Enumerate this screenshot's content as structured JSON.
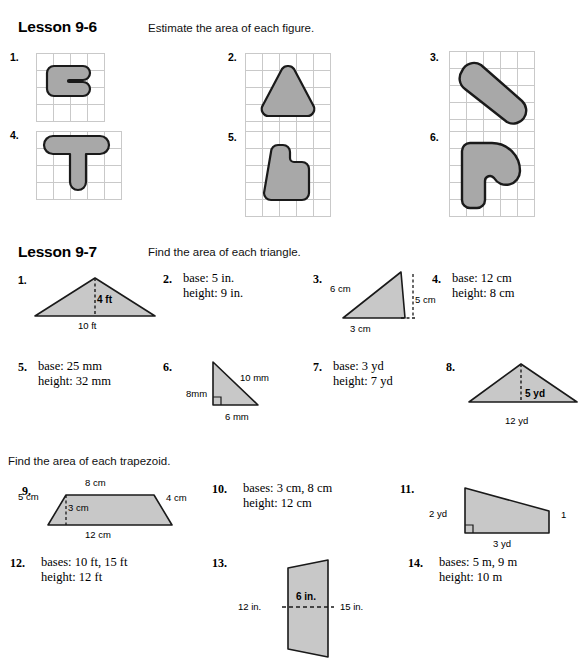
{
  "page": {
    "width": 588,
    "height": 670,
    "background": "#ffffff"
  },
  "style": {
    "shape_fill": "#a8a8a8",
    "shape_fill_light": "#c8c8c8",
    "shape_stroke": "#1a1a1a",
    "grid_line": "#c9c9c9"
  },
  "lesson1": {
    "title": "Lesson 9-6",
    "direction": "Estimate the area of each figure.",
    "problems": [
      {
        "number": "1.",
        "figure": "blocky-C-shape",
        "grid": "5x5"
      },
      {
        "number": "2.",
        "figure": "rounded-triangle",
        "grid": "5x5"
      },
      {
        "number": "3.",
        "figure": "diagonal-capsule",
        "grid": "5x5"
      },
      {
        "number": "4.",
        "figure": "rounded-T-shape",
        "grid": "5x5"
      },
      {
        "number": "5.",
        "figure": "rounded-step-block",
        "grid": "5x5"
      },
      {
        "number": "6.",
        "figure": "rounded-hook-shape",
        "grid": "5x5"
      }
    ]
  },
  "lesson2": {
    "title": "Lesson 9-7",
    "direction": "Find the area of each triangle.",
    "problems": [
      {
        "number": "1.",
        "type": "figure",
        "labels": {
          "height": "4 ft",
          "base": "10 ft"
        }
      },
      {
        "number": "2.",
        "type": "text",
        "line1": "base: 5 in.",
        "line2": "height: 9 in."
      },
      {
        "number": "3.",
        "type": "figure",
        "labels": {
          "side": "6 cm",
          "height": "5 cm",
          "base": "3 cm"
        }
      },
      {
        "number": "4.",
        "type": "text",
        "line1": "base: 12 cm",
        "line2": "height: 8 cm"
      },
      {
        "number": "5.",
        "type": "text",
        "line1": "base: 25 mm",
        "line2": "height: 32 mm"
      },
      {
        "number": "6.",
        "type": "figure",
        "labels": {
          "hyp": "10 mm",
          "side": "8mm",
          "base": "6 mm"
        }
      },
      {
        "number": "7.",
        "type": "text",
        "line1": "base: 3 yd",
        "line2": "height: 7 yd"
      },
      {
        "number": "8.",
        "type": "figure",
        "labels": {
          "height": "5 yd",
          "base": "12 yd"
        }
      }
    ]
  },
  "lesson3": {
    "direction": "Find the area of each trapezoid.",
    "problems": [
      {
        "number": "9.",
        "type": "figure",
        "labels": {
          "top": "8 cm",
          "left": "5 cm",
          "right": "4 cm",
          "height": "3 cm",
          "bottom": "12 cm"
        }
      },
      {
        "number": "10.",
        "type": "text",
        "line1": "bases: 3 cm, 8 cm",
        "line2": "height: 12 cm"
      },
      {
        "number": "11.",
        "type": "figure",
        "labels": {
          "left": "2 yd",
          "bottom": "3 yd",
          "right": "1"
        }
      },
      {
        "number": "12.",
        "type": "text",
        "line1": "bases: 10 ft, 15 ft",
        "line2": "height: 12 ft"
      },
      {
        "number": "13.",
        "type": "figure",
        "labels": {
          "left": "12 in.",
          "mid": "6 in.",
          "right": "15 in."
        }
      },
      {
        "number": "14.",
        "type": "text",
        "line1": "bases: 5 m, 9 m",
        "line2": "height: 10 m"
      }
    ]
  }
}
